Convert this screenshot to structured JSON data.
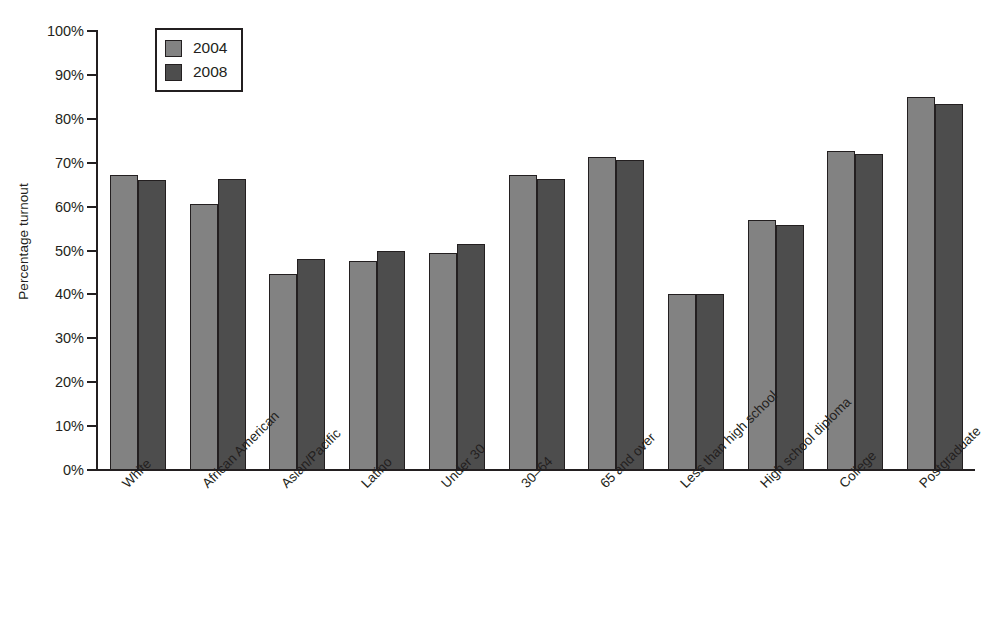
{
  "chart_data": {
    "type": "bar",
    "title": "",
    "xlabel": "",
    "ylabel": "Percentage turnout",
    "ylim": [
      0,
      100
    ],
    "ytick_labels": [
      "100%",
      "90%",
      "80%",
      "70%",
      "60%",
      "50%",
      "40%",
      "30%",
      "20%",
      "10%",
      "0%"
    ],
    "ytick_values": [
      100,
      90,
      80,
      70,
      60,
      50,
      40,
      30,
      20,
      10,
      0
    ],
    "grid": false,
    "legend_position": "top-left",
    "categories": [
      "White",
      "African American",
      "Asian/Pacific",
      "Latino",
      "Under 30",
      "30–64",
      "65 and over",
      "Less than high school",
      "High school diploma",
      "College",
      "Postgraduate"
    ],
    "series": [
      {
        "name": "2004",
        "color": "#828282",
        "values": [
          67.3,
          60.5,
          44.7,
          47.5,
          49.5,
          67.1,
          71.4,
          40.0,
          57.0,
          72.7,
          85.0
        ]
      },
      {
        "name": "2008",
        "color": "#4d4d4d",
        "values": [
          66.1,
          66.2,
          48.0,
          50.0,
          51.5,
          66.3,
          70.7,
          40.0,
          55.7,
          72.0,
          83.4
        ]
      }
    ]
  },
  "legend": {
    "entries": [
      {
        "label": "2004"
      },
      {
        "label": "2008"
      }
    ]
  },
  "colors": {
    "series_2004": "#828282",
    "series_2008": "#4d4d4d",
    "axis": "#231f20",
    "background": "#ffffff"
  }
}
